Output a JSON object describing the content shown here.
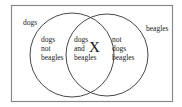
{
  "diagram": {
    "type": "venn",
    "set_labels": {
      "left": "dogs",
      "right": "beagles"
    },
    "regions": {
      "left_only": [
        "dogs",
        "not",
        "beagles"
      ],
      "intersection": [
        "dogs",
        "and",
        "beagles"
      ],
      "right_only": [
        "not",
        "dogs",
        "beagles"
      ]
    },
    "marker": "X",
    "colors": {
      "frame": "#8a8a8a",
      "circle": "#333333",
      "text": "#222222"
    }
  }
}
